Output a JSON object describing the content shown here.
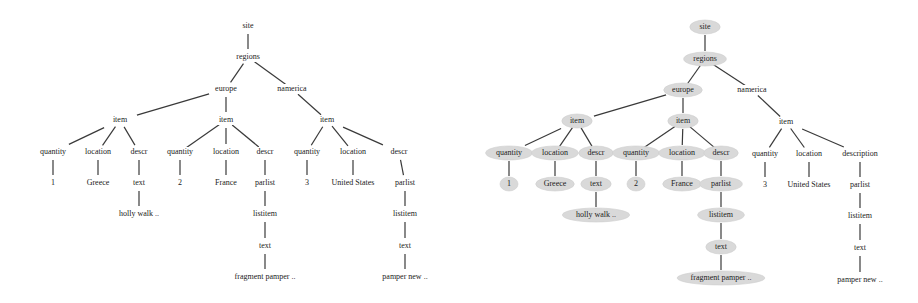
{
  "colors": {
    "edge": "#3a3a3a",
    "text": "#222222",
    "highlight": "#d9d9d9"
  },
  "trees": [
    {
      "name": "left-tree",
      "nodes": [
        {
          "id": "site",
          "label": "site",
          "x": 248,
          "y": 26,
          "hl": false
        },
        {
          "id": "regions",
          "label": "regions",
          "x": 248,
          "y": 57,
          "hl": false
        },
        {
          "id": "europe",
          "label": "europe",
          "x": 226,
          "y": 89,
          "hl": false
        },
        {
          "id": "namerica",
          "label": "namerica",
          "x": 292,
          "y": 89,
          "hl": false
        },
        {
          "id": "item1",
          "label": "item",
          "x": 120,
          "y": 120,
          "hl": false
        },
        {
          "id": "item2",
          "label": "item",
          "x": 226,
          "y": 120,
          "hl": false
        },
        {
          "id": "item3",
          "label": "item",
          "x": 327,
          "y": 120,
          "hl": false
        },
        {
          "id": "q1",
          "label": "quantity",
          "x": 53,
          "y": 152,
          "hl": false
        },
        {
          "id": "l1",
          "label": "location",
          "x": 98,
          "y": 152,
          "hl": false
        },
        {
          "id": "d1",
          "label": "descr",
          "x": 139,
          "y": 152,
          "hl": false
        },
        {
          "id": "q2",
          "label": "quantity",
          "x": 180,
          "y": 152,
          "hl": false
        },
        {
          "id": "l2",
          "label": "location",
          "x": 226,
          "y": 152,
          "hl": false
        },
        {
          "id": "d2",
          "label": "descr",
          "x": 265,
          "y": 152,
          "hl": false
        },
        {
          "id": "q3",
          "label": "quantity",
          "x": 307,
          "y": 152,
          "hl": false
        },
        {
          "id": "l3",
          "label": "location",
          "x": 353,
          "y": 152,
          "hl": false
        },
        {
          "id": "d3",
          "label": "descr",
          "x": 399,
          "y": 152,
          "hl": false
        },
        {
          "id": "v1",
          "label": "1",
          "x": 53,
          "y": 183,
          "hl": false
        },
        {
          "id": "v2",
          "label": "Greece",
          "x": 98,
          "y": 183,
          "hl": false
        },
        {
          "id": "t1",
          "label": "text",
          "x": 139,
          "y": 183,
          "hl": false
        },
        {
          "id": "v3",
          "label": "2",
          "x": 180,
          "y": 183,
          "hl": false
        },
        {
          "id": "v4",
          "label": "France",
          "x": 226,
          "y": 183,
          "hl": false
        },
        {
          "id": "p2",
          "label": "parlist",
          "x": 265,
          "y": 183,
          "hl": false
        },
        {
          "id": "v5",
          "label": "3",
          "x": 307,
          "y": 183,
          "hl": false
        },
        {
          "id": "v6",
          "label": "United States",
          "x": 353,
          "y": 183,
          "hl": false
        },
        {
          "id": "p3",
          "label": "parlist",
          "x": 405,
          "y": 183,
          "hl": false
        },
        {
          "id": "hw",
          "label": "holly walk ..",
          "x": 139,
          "y": 214,
          "hl": false
        },
        {
          "id": "li2",
          "label": "listitem",
          "x": 265,
          "y": 214,
          "hl": false
        },
        {
          "id": "li3",
          "label": "listitem",
          "x": 405,
          "y": 214,
          "hl": false
        },
        {
          "id": "t2",
          "label": "text",
          "x": 265,
          "y": 246,
          "hl": false
        },
        {
          "id": "t3",
          "label": "text",
          "x": 405,
          "y": 246,
          "hl": false
        },
        {
          "id": "fp",
          "label": "fragment pamper ..",
          "x": 265,
          "y": 277,
          "hl": false
        },
        {
          "id": "pn",
          "label": "pamper new ..",
          "x": 405,
          "y": 277,
          "hl": false
        }
      ]
    },
    {
      "name": "right-tree",
      "nodes": [
        {
          "id": "site",
          "label": "site",
          "x": 705,
          "y": 27,
          "hl": true
        },
        {
          "id": "regions",
          "label": "regions",
          "x": 705,
          "y": 59,
          "hl": true
        },
        {
          "id": "europe",
          "label": "europe",
          "x": 683,
          "y": 90,
          "hl": true
        },
        {
          "id": "namerica",
          "label": "namerica",
          "x": 752,
          "y": 90,
          "hl": false
        },
        {
          "id": "item1",
          "label": "item",
          "x": 577,
          "y": 121,
          "hl": true
        },
        {
          "id": "item2",
          "label": "item",
          "x": 683,
          "y": 121,
          "hl": true
        },
        {
          "id": "item3",
          "label": "item",
          "x": 786,
          "y": 122,
          "hl": false
        },
        {
          "id": "q1",
          "label": "quantity",
          "x": 509,
          "y": 153,
          "hl": true
        },
        {
          "id": "l1",
          "label": "location",
          "x": 555,
          "y": 153,
          "hl": true
        },
        {
          "id": "d1",
          "label": "descr",
          "x": 596,
          "y": 153,
          "hl": true
        },
        {
          "id": "q2",
          "label": "quantity",
          "x": 636,
          "y": 153,
          "hl": true
        },
        {
          "id": "l2",
          "label": "location",
          "x": 682,
          "y": 153,
          "hl": true
        },
        {
          "id": "d2",
          "label": "descr",
          "x": 721,
          "y": 153,
          "hl": true
        },
        {
          "id": "q3",
          "label": "quantity",
          "x": 765,
          "y": 154,
          "hl": false
        },
        {
          "id": "l3",
          "label": "location",
          "x": 809,
          "y": 154,
          "hl": false
        },
        {
          "id": "d3",
          "label": "description",
          "x": 860,
          "y": 154,
          "hl": false
        },
        {
          "id": "v1",
          "label": "1",
          "x": 509,
          "y": 184,
          "hl": true
        },
        {
          "id": "v2",
          "label": "Greece",
          "x": 555,
          "y": 184,
          "hl": true
        },
        {
          "id": "t1",
          "label": "text",
          "x": 596,
          "y": 184,
          "hl": true
        },
        {
          "id": "v3",
          "label": "2",
          "x": 636,
          "y": 184,
          "hl": true
        },
        {
          "id": "v4",
          "label": "France",
          "x": 682,
          "y": 184,
          "hl": true
        },
        {
          "id": "p2",
          "label": "parlist",
          "x": 721,
          "y": 184,
          "hl": true
        },
        {
          "id": "v5",
          "label": "3",
          "x": 765,
          "y": 185,
          "hl": false
        },
        {
          "id": "v6",
          "label": "United States",
          "x": 809,
          "y": 185,
          "hl": false
        },
        {
          "id": "p3",
          "label": "parlist",
          "x": 860,
          "y": 185,
          "hl": false
        },
        {
          "id": "hw",
          "label": "holly walk ..",
          "x": 596,
          "y": 215,
          "hl": true
        },
        {
          "id": "li2",
          "label": "listitem",
          "x": 721,
          "y": 215,
          "hl": true
        },
        {
          "id": "li3",
          "label": "listitem",
          "x": 860,
          "y": 216,
          "hl": false
        },
        {
          "id": "t2",
          "label": "text",
          "x": 721,
          "y": 247,
          "hl": true
        },
        {
          "id": "t3",
          "label": "text",
          "x": 860,
          "y": 248,
          "hl": false
        },
        {
          "id": "fp",
          "label": "fragment pamper ..",
          "x": 721,
          "y": 278,
          "hl": true
        },
        {
          "id": "pn",
          "label": "pamper new ..",
          "x": 860,
          "y": 280,
          "hl": false
        }
      ]
    }
  ],
  "edges": [
    [
      "site",
      "regions"
    ],
    [
      "regions",
      "europe"
    ],
    [
      "regions",
      "namerica"
    ],
    [
      "europe",
      "item1"
    ],
    [
      "europe",
      "item2"
    ],
    [
      "namerica",
      "item3"
    ],
    [
      "item1",
      "q1"
    ],
    [
      "item1",
      "l1"
    ],
    [
      "item1",
      "d1"
    ],
    [
      "item2",
      "q2"
    ],
    [
      "item2",
      "l2"
    ],
    [
      "item2",
      "d2"
    ],
    [
      "item3",
      "q3"
    ],
    [
      "item3",
      "l3"
    ],
    [
      "item3",
      "d3"
    ],
    [
      "q1",
      "v1"
    ],
    [
      "l1",
      "v2"
    ],
    [
      "d1",
      "t1"
    ],
    [
      "q2",
      "v3"
    ],
    [
      "l2",
      "v4"
    ],
    [
      "d2",
      "p2"
    ],
    [
      "q3",
      "v5"
    ],
    [
      "l3",
      "v6"
    ],
    [
      "d3",
      "p3"
    ],
    [
      "t1",
      "hw"
    ],
    [
      "p2",
      "li2"
    ],
    [
      "p3",
      "li3"
    ],
    [
      "li2",
      "t2"
    ],
    [
      "li3",
      "t3"
    ],
    [
      "t2",
      "fp"
    ],
    [
      "t3",
      "pn"
    ]
  ]
}
